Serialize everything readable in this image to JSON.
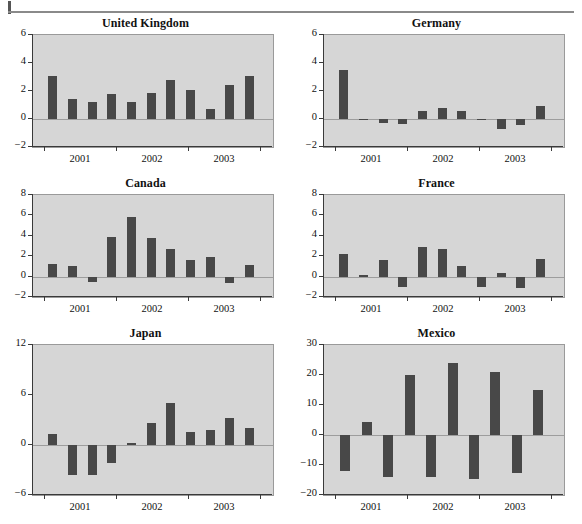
{
  "figure": {
    "divider": "horizontal-rule",
    "background": "#ffffff",
    "bar_color": "#484848",
    "plot_background": "#d6d6d6",
    "axis_color": "#3a3a3a"
  },
  "chart_data": [
    {
      "type": "bar",
      "title": "United Kingdom",
      "xlabel": "",
      "ylabel": "",
      "ylim": [
        -2,
        6
      ],
      "yticks": [
        -2,
        0,
        2,
        4,
        6
      ],
      "ytick_labels": [
        "-2",
        "0",
        "2",
        "4",
        "6"
      ],
      "xticks": [
        2001,
        2002,
        2003
      ],
      "xtick_labels": [
        "2001",
        "2002",
        "2003"
      ],
      "grid": false,
      "legend": "none",
      "categories": [
        "2000Q4",
        "2001Q1",
        "2001Q2",
        "2001Q3",
        "2001Q4",
        "2002Q1",
        "2002Q2",
        "2002Q3",
        "2002Q4",
        "2003Q1",
        "2003Q2"
      ],
      "values": [
        3.1,
        1.4,
        1.2,
        1.8,
        1.25,
        1.85,
        2.8,
        2.05,
        0.7,
        2.45,
        3.1
      ]
    },
    {
      "type": "bar",
      "title": "Germany",
      "xlabel": "",
      "ylabel": "",
      "ylim": [
        -2,
        6
      ],
      "yticks": [
        -2,
        0,
        2,
        4,
        6
      ],
      "ytick_labels": [
        "-2",
        "0",
        "2",
        "4",
        "6"
      ],
      "xticks": [
        2001,
        2002,
        2003
      ],
      "xtick_labels": [
        "2001",
        "2002",
        "2003"
      ],
      "grid": false,
      "legend": "none",
      "categories": [
        "2000Q4",
        "2001Q1",
        "2001Q2",
        "2001Q3",
        "2001Q4",
        "2002Q1",
        "2002Q2",
        "2002Q3",
        "2002Q4",
        "2003Q1",
        "2003Q2"
      ],
      "values": [
        3.5,
        -0.05,
        -0.3,
        -0.35,
        0.6,
        0.8,
        0.6,
        -0.1,
        -0.7,
        -0.45,
        0.9
      ]
    },
    {
      "type": "bar",
      "title": "Canada",
      "xlabel": "",
      "ylabel": "",
      "ylim": [
        -2,
        8
      ],
      "yticks": [
        -2,
        0,
        2,
        4,
        6,
        8
      ],
      "ytick_labels": [
        "-2",
        "0",
        "2",
        "4",
        "6",
        "8"
      ],
      "xticks": [
        2001,
        2002,
        2003
      ],
      "xtick_labels": [
        "2001",
        "2002",
        "2003"
      ],
      "grid": false,
      "legend": "none",
      "categories": [
        "2000Q4",
        "2001Q1",
        "2001Q2",
        "2001Q3",
        "2001Q4",
        "2002Q1",
        "2002Q2",
        "2002Q3",
        "2002Q4",
        "2003Q1",
        "2003Q2"
      ],
      "values": [
        1.2,
        1.0,
        -0.5,
        3.9,
        5.8,
        3.75,
        2.7,
        1.65,
        1.9,
        -0.6,
        1.15
      ]
    },
    {
      "type": "bar",
      "title": "France",
      "xlabel": "",
      "ylabel": "",
      "ylim": [
        -2,
        8
      ],
      "yticks": [
        -2,
        0,
        2,
        4,
        6,
        8
      ],
      "ytick_labels": [
        "-2",
        "0",
        "2",
        "4",
        "6",
        "8"
      ],
      "xticks": [
        2001,
        2002,
        2003
      ],
      "xtick_labels": [
        "2001",
        "2002",
        "2003"
      ],
      "grid": false,
      "legend": "none",
      "categories": [
        "2000Q4",
        "2001Q1",
        "2001Q2",
        "2001Q3",
        "2001Q4",
        "2002Q1",
        "2002Q2",
        "2002Q3",
        "2002Q4",
        "2003Q1",
        "2003Q2"
      ],
      "values": [
        2.2,
        0.15,
        1.65,
        -1.0,
        2.95,
        2.75,
        1.0,
        -1.0,
        0.35,
        -1.1,
        1.7
      ]
    },
    {
      "type": "bar",
      "title": "Japan",
      "xlabel": "",
      "ylabel": "",
      "ylim": [
        -6,
        12
      ],
      "yticks": [
        -6,
        0,
        6,
        12
      ],
      "ytick_labels": [
        "-6",
        "0",
        "6",
        "12"
      ],
      "xticks": [
        2001,
        2002,
        2003
      ],
      "xtick_labels": [
        "2001",
        "2002",
        "2003"
      ],
      "grid": false,
      "legend": "none",
      "categories": [
        "2000Q4",
        "2001Q1",
        "2001Q2",
        "2001Q3",
        "2001Q4",
        "2002Q1",
        "2002Q2",
        "2002Q3",
        "2002Q4",
        "2003Q1",
        "2003Q2"
      ],
      "values": [
        1.3,
        -3.6,
        -3.6,
        -2.2,
        0.2,
        2.6,
        5.1,
        1.6,
        1.8,
        3.3,
        2.0
      ]
    },
    {
      "type": "bar",
      "title": "Mexico",
      "xlabel": "",
      "ylabel": "",
      "ylim": [
        -20,
        30
      ],
      "yticks": [
        -20,
        -10,
        0,
        10,
        20,
        30
      ],
      "ytick_labels": [
        "-20",
        "-10",
        "0",
        "10",
        "20",
        "30"
      ],
      "xticks": [
        2001,
        2002,
        2003
      ],
      "xtick_labels": [
        "2001",
        "2002",
        "2003"
      ],
      "grid": false,
      "legend": "none",
      "categories": [
        "2000Q4",
        "2001Q1",
        "2001Q2",
        "2001Q3",
        "2001Q4",
        "2002Q1",
        "2002Q2",
        "2002Q3",
        "2002Q4",
        "2003Q1"
      ],
      "values": [
        -12.0,
        4.5,
        -14.0,
        20.0,
        -14.0,
        24.0,
        -14.5,
        21.0,
        -12.5,
        15.0
      ]
    }
  ]
}
